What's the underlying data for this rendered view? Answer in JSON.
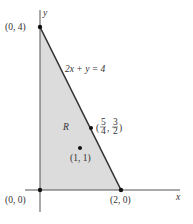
{
  "diagram": {
    "axes": {
      "x_label": "x",
      "y_label": "y"
    },
    "region": {
      "label": "R",
      "fill": "#dcdcdc"
    },
    "line": {
      "equation": "2x + y = 4",
      "color": "#333333"
    },
    "points": [
      {
        "id": "p04",
        "label": "(0, 4)",
        "x": 0,
        "y": 4
      },
      {
        "id": "p00",
        "label": "(0, 0)",
        "x": 0,
        "y": 0
      },
      {
        "id": "p20",
        "label": "(2, 0)",
        "x": 2,
        "y": 0
      },
      {
        "id": "p11",
        "label": "(1, 1)",
        "x": 1,
        "y": 1
      },
      {
        "id": "p54",
        "label": "(5/4, 3/2)",
        "x": 1.25,
        "y": 1.5,
        "frac": {
          "a_num": "5",
          "a_den": "4",
          "b_num": "3",
          "b_den": "2"
        }
      }
    ]
  }
}
